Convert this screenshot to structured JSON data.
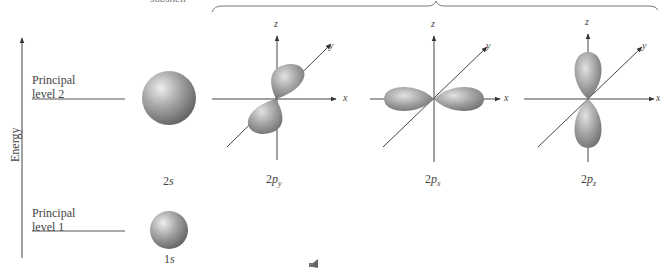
{
  "figure": {
    "top_caption_partial": "subshell",
    "energy_axis": {
      "label": "Energy"
    },
    "levels": [
      {
        "name": "Principal level 2",
        "line1": "Principal",
        "line2": "level 2"
      },
      {
        "name": "Principal level 1",
        "line1": "Principal",
        "line2": "level 1"
      }
    ],
    "orbitals": [
      {
        "id": "2s",
        "n": "2",
        "l": "s",
        "sub": ""
      },
      {
        "id": "2py",
        "n": "2",
        "l": "p",
        "sub": "y"
      },
      {
        "id": "2px",
        "n": "2",
        "l": "p",
        "sub": "x"
      },
      {
        "id": "2pz",
        "n": "2",
        "l": "p",
        "sub": "z"
      },
      {
        "id": "1s",
        "n": "1",
        "l": "s",
        "sub": ""
      }
    ],
    "axes": {
      "x": "x",
      "y": "y",
      "z": "z"
    },
    "colors": {
      "orbital_fill": "#8c8c8c",
      "orbital_highlight": "#e6e6e6",
      "line": "#555555"
    }
  }
}
